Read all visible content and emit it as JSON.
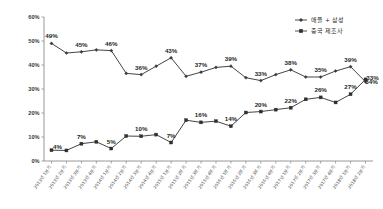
{
  "chart_data": {
    "type": "line",
    "title": "",
    "xlabel": "",
    "ylabel": "",
    "ylim": [
      0,
      60
    ],
    "ytick_labels": [
      "0%",
      "10%",
      "20%",
      "30%",
      "40%",
      "50%",
      "60%"
    ],
    "ytick_values": [
      0,
      10,
      20,
      30,
      40,
      50,
      60
    ],
    "grid": false,
    "legend_position": "top-right",
    "categories": [
      "2013년 1분기",
      "2013년 2분기",
      "2013년 3분기",
      "2013년 4분기",
      "2014년 1분기",
      "2014년 2분기",
      "2014년 3분기",
      "2014년 4분기",
      "2015년 1분기",
      "2015년 2분기",
      "2015년 3분기",
      "2015년 4분기",
      "2016년 1분기",
      "2016년 2분기",
      "2016년 3분기",
      "2016년 4분기",
      "2017년 1분기",
      "2017년 2분기",
      "2017년 3분기",
      "2017년 4분기",
      "2018년 1분기",
      "2018년 2분기"
    ],
    "series": [
      {
        "name": "애플 + 삼성",
        "marker": "diamond",
        "values": [
          49,
          45,
          45.5,
          46.3,
          46,
          36.5,
          36,
          39.5,
          43,
          35.3,
          37,
          39,
          39.5,
          34.7,
          33.5,
          36,
          38,
          35,
          35,
          37.5,
          39.3,
          33
        ],
        "labels": [
          {
            "index": 0,
            "text": "49%"
          },
          {
            "index": 2,
            "text": "45%"
          },
          {
            "index": 4,
            "text": "46%"
          },
          {
            "index": 6,
            "text": "36%"
          },
          {
            "index": 8,
            "text": "43%"
          },
          {
            "index": 10,
            "text": "37%"
          },
          {
            "index": 12,
            "text": "39%"
          },
          {
            "index": 14,
            "text": "33%"
          },
          {
            "index": 16,
            "text": "38%"
          },
          {
            "index": 18,
            "text": "35%"
          },
          {
            "index": 20,
            "text": "39%"
          },
          {
            "index": 21,
            "text": "33%"
          }
        ]
      },
      {
        "name": "중국 제조사",
        "marker": "square",
        "values": [
          4.5,
          4.4,
          7.2,
          8,
          5.2,
          10.4,
          10.3,
          11,
          7.7,
          17,
          16.1,
          16.6,
          14.5,
          20.2,
          20.6,
          21.4,
          22.2,
          25.7,
          26.5,
          24.4,
          27.8,
          34
        ],
        "labels": [
          {
            "index": 0,
            "text": "4%"
          },
          {
            "index": 2,
            "text": "7%"
          },
          {
            "index": 4,
            "text": "5%"
          },
          {
            "index": 6,
            "text": "10%"
          },
          {
            "index": 8,
            "text": "7%"
          },
          {
            "index": 10,
            "text": "16%"
          },
          {
            "index": 12,
            "text": "14%"
          },
          {
            "index": 14,
            "text": "20%"
          },
          {
            "index": 16,
            "text": "22%"
          },
          {
            "index": 18,
            "text": "26%"
          },
          {
            "index": 20,
            "text": "27%"
          },
          {
            "index": 21,
            "text": "34%"
          }
        ]
      }
    ],
    "colors": {
      "series_1": "#3b3b3b",
      "series_2": "#2e2e2e",
      "axis": "#8d8d8d",
      "text": "#262626",
      "background": "#ffffff"
    }
  }
}
